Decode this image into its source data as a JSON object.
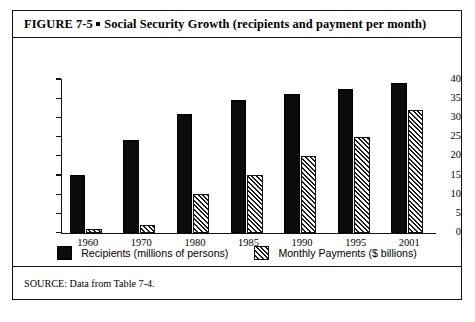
{
  "figure": {
    "label": "FIGURE  7-5",
    "title": "Social Security Growth (recipients and payment per month)",
    "source": "SOURCE: Data from Table 7-4."
  },
  "legend": {
    "items": [
      {
        "name": "recipients",
        "label": "Recipients (millions of persons)",
        "swatch": "solid-black-square"
      },
      {
        "name": "payments",
        "label": "Monthly Payments ($ billions)",
        "swatch": "diagonal-hatched-square"
      }
    ]
  },
  "colors": {
    "recipients_fill": "#0b0b0b",
    "payments_fill": "#ffffff",
    "payments_hatch": "#1a1a1a",
    "axis": "#111111",
    "frame": "#111111",
    "background": "#ffffff"
  },
  "chart_data": {
    "type": "bar",
    "title": "Social Security Growth (recipients and payment per month)",
    "xlabel": "",
    "ylabel": "",
    "ylim": [
      0,
      40
    ],
    "yticks": [
      0,
      5,
      10,
      15,
      20,
      25,
      30,
      35,
      40
    ],
    "grid": false,
    "legend_position": "bottom",
    "categories": [
      "1960",
      "1970",
      "1980",
      "1985",
      "1990",
      "1995",
      "2001"
    ],
    "series": [
      {
        "name": "Recipients (millions of persons)",
        "values": [
          15,
          24,
          31,
          34.5,
          36,
          37.5,
          39
        ]
      },
      {
        "name": "Monthly Payments ($ billions)",
        "values": [
          1,
          2,
          10,
          15,
          20,
          25,
          32
        ]
      }
    ]
  }
}
